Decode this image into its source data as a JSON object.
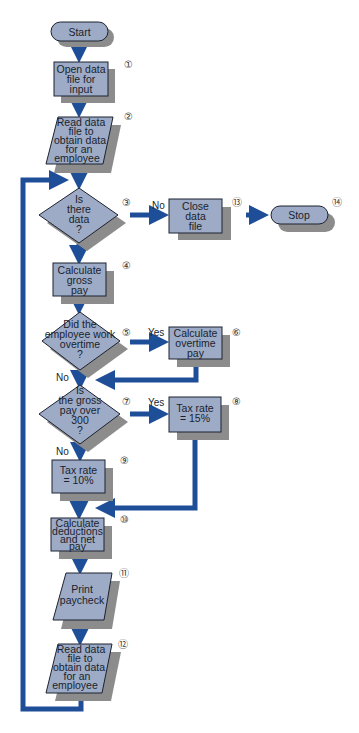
{
  "colors": {
    "shape_fill": "#9dabc6",
    "shape_stroke": "#1d2230",
    "shadow": "#8c8c8c",
    "arrow": "#1f4e98",
    "background": "#ffffff"
  },
  "nodes": {
    "start": {
      "lines": [
        "Start"
      ],
      "type": "terminator"
    },
    "n1": {
      "number": "①",
      "lines": [
        "Open data",
        "file for",
        "input"
      ],
      "type": "process"
    },
    "n2": {
      "number": "②",
      "lines": [
        "Read data",
        "file to",
        "obtain data",
        "for an",
        "employee"
      ],
      "type": "input-output"
    },
    "n3": {
      "number": "③",
      "lines": [
        "Is",
        "there",
        "data",
        "?"
      ],
      "type": "decision"
    },
    "n4": {
      "number": "④",
      "lines": [
        "Calculate",
        "gross",
        "pay"
      ],
      "type": "process"
    },
    "n5": {
      "number": "⑤",
      "lines": [
        "Did the",
        "employee work",
        "overtime",
        "?"
      ],
      "type": "decision"
    },
    "n6": {
      "number": "⑥",
      "lines": [
        "Calculate",
        "overtime",
        "pay"
      ],
      "type": "process"
    },
    "n7": {
      "number": "⑦",
      "lines": [
        "Is",
        "the gross",
        "pay over",
        "300",
        "?"
      ],
      "type": "decision"
    },
    "n8": {
      "number": "⑧",
      "lines": [
        "Tax rate",
        "= 15%"
      ],
      "type": "process"
    },
    "n9": {
      "number": "⑨",
      "lines": [
        "Tax rate",
        "= 10%"
      ],
      "type": "process"
    },
    "n10": {
      "number": "⑩",
      "lines": [
        "Calculate",
        "deductions",
        "and net",
        "pay"
      ],
      "type": "process"
    },
    "n11": {
      "number": "⑪",
      "lines": [
        "Print",
        "paycheck"
      ],
      "type": "input-output"
    },
    "n12": {
      "number": "⑫",
      "lines": [
        "Read data",
        "file to",
        "obtain data",
        "for an",
        "employee"
      ],
      "type": "input-output"
    },
    "n13": {
      "number": "⑬",
      "lines": [
        "Close",
        "data",
        "file"
      ],
      "type": "process"
    },
    "stop": {
      "number": "⑭",
      "lines": [
        "Stop"
      ],
      "type": "terminator"
    }
  },
  "edge_labels": {
    "n3_no": "No",
    "n5_yes": "Yes",
    "n5_no": "No",
    "n7_yes": "Yes",
    "n7_no": "No"
  }
}
